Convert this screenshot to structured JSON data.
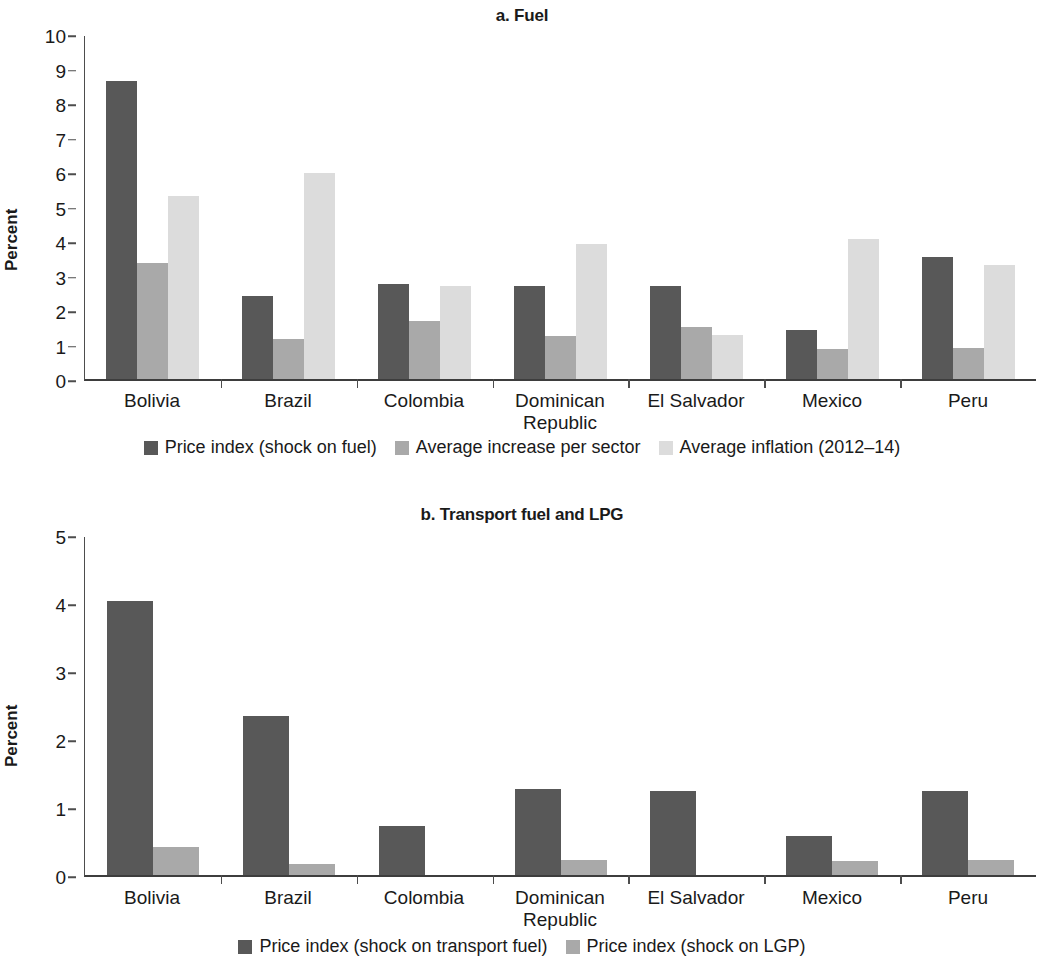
{
  "chart_data": [
    {
      "type": "bar",
      "panel": "a",
      "title": "a. Fuel",
      "xlabel": "",
      "ylabel": "Percent",
      "ylim": [
        0,
        10
      ],
      "yticks": [
        0,
        1,
        2,
        3,
        4,
        5,
        6,
        7,
        8,
        9,
        10
      ],
      "ytick_labels": [
        "0",
        "1",
        "2",
        "3",
        "4",
        "5",
        "6",
        "7",
        "8",
        "9",
        "10"
      ],
      "grid": false,
      "legend_position": "bottom",
      "categories": [
        "Bolivia",
        "Brazil",
        "Colombia",
        "Dominican\nRepublic",
        "El Salvador",
        "Mexico",
        "Peru"
      ],
      "series": [
        {
          "name": "Price index (shock on fuel)",
          "color": "#585858",
          "values": [
            8.7,
            2.42,
            2.78,
            2.72,
            2.7,
            1.42,
            3.55
          ]
        },
        {
          "name": "Average increase per sector",
          "color": "#a9a9a9",
          "values": [
            3.37,
            1.18,
            1.7,
            1.25,
            1.52,
            0.88,
            0.9
          ]
        },
        {
          "name": "Average inflation (2012–14)",
          "color": "#dcdcdc",
          "values": [
            5.35,
            6.0,
            2.7,
            3.93,
            1.27,
            4.08,
            3.33
          ]
        }
      ]
    },
    {
      "type": "bar",
      "panel": "b",
      "title": "b. Transport fuel and LPG",
      "xlabel": "",
      "ylabel": "Percent",
      "ylim": [
        0,
        5
      ],
      "yticks": [
        0,
        1,
        2,
        3,
        4,
        5
      ],
      "ytick_labels": [
        "0",
        "1",
        "2",
        "3",
        "4",
        "5"
      ],
      "grid": false,
      "legend_position": "bottom",
      "categories": [
        "Bolivia",
        "Brazil",
        "Colombia",
        "Dominican\nRepublic",
        "El Salvador",
        "Mexico",
        "Peru"
      ],
      "series": [
        {
          "name": "Price index (shock on transport fuel)",
          "color": "#585858",
          "values": [
            4.05,
            2.35,
            0.73,
            1.27,
            1.25,
            0.58,
            1.24
          ]
        },
        {
          "name": "Price index (shock on LGP)",
          "color": "#a9a9a9",
          "values": [
            0.42,
            0.17,
            0,
            0.22,
            0,
            0.21,
            0.22
          ]
        }
      ]
    }
  ]
}
